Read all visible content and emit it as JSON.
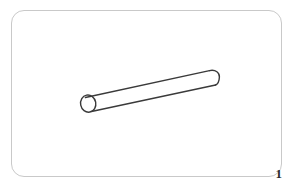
{
  "figure": {
    "number_label": "1",
    "caption": "",
    "card": {
      "background_color": "#ffffff",
      "border_color": "#c9c9c9",
      "corner_radius_px": 13,
      "x": 11,
      "y": 10,
      "width": 271,
      "height": 167
    },
    "drawing": {
      "name": "cylinder-line-drawing",
      "description": "Open-ended cylindrical tube drawn in outline, tilted upward to the right",
      "stroke_color": "#3a3a3a",
      "stroke_width_px": 1.4,
      "fill_color": "none",
      "orientation_degrees": -11,
      "open_end": "left",
      "capped_end": "right",
      "left_end": {
        "name": "open-circular-mouth",
        "center_x": 88,
        "center_y": 103,
        "radius_x": 8,
        "radius_y": 9
      },
      "right_end": {
        "name": "rounded-end-cap",
        "center_x": 212,
        "center_y": 78,
        "radius_x": 7,
        "radius_y": 8
      },
      "body_lines": [
        {
          "name": "upper-edge",
          "x1": 86,
          "y1": 95,
          "x2": 211,
          "y2": 70
        },
        {
          "name": "lower-edge",
          "x1": 92,
          "y1": 111,
          "x2": 216,
          "y2": 86
        }
      ]
    }
  }
}
